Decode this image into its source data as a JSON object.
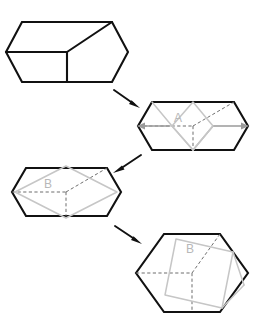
{
  "figure": {
    "background_color": "#ffffff",
    "width": 254,
    "height": 335,
    "colors": {
      "outline": "#111111",
      "hidden_edge": "#666666",
      "ghost_shape": "#c6c6c6",
      "label_text": "#b8b8b8",
      "span_arrow": "#9a9a9a"
    }
  },
  "panels": [
    {
      "id": "panel-1",
      "name": "cube-isometric",
      "label": "",
      "description": "Isometric cube drawn as a hexagon with three visible faces meeting at the center vertex",
      "center": {
        "x": 67,
        "y": 52
      },
      "radius": 52,
      "has_label": false,
      "has_ghost": false,
      "has_hidden_edges": false,
      "has_span_arrows": false
    },
    {
      "id": "panel-2",
      "name": "hexagon-with-rhombus-a",
      "label": "A",
      "description": "Hexagon with hidden dashed edges and a tall light-gray rhombus labelled A, with horizontal span arrows",
      "center": {
        "x": 193,
        "y": 126
      },
      "radius": 48,
      "has_label": true,
      "has_ghost": true,
      "has_hidden_edges": true,
      "has_span_arrows": true
    },
    {
      "id": "panel-3",
      "name": "hexagon-with-square-b",
      "label": "B",
      "description": "Hexagon with hidden dashed edges and a light-gray square rotated 45 degrees labelled B",
      "center": {
        "x": 66,
        "y": 192
      },
      "radius": 48,
      "has_label": true,
      "has_ghost": true,
      "has_hidden_edges": true,
      "has_span_arrows": false
    },
    {
      "id": "panel-4",
      "name": "hexagon-with-tilted-square-b",
      "label": "B",
      "description": "Hexagon with hidden dashed edges and a light-gray tilted square labelled B",
      "center": {
        "x": 192,
        "y": 273
      },
      "radius": 53,
      "has_label": true,
      "has_ghost": true,
      "has_hidden_edges": true,
      "has_span_arrows": false
    }
  ],
  "arrows": [
    {
      "id": "arrow-1",
      "name": "arrow-panel1-to-panel2",
      "direction": "down-right",
      "from": "panel-1",
      "to": "panel-2",
      "start": {
        "x": 114,
        "y": 90
      },
      "end": {
        "x": 139,
        "y": 107
      }
    },
    {
      "id": "arrow-2",
      "name": "arrow-panel2-to-panel3",
      "direction": "down-left",
      "from": "panel-2",
      "to": "panel-3",
      "start": {
        "x": 141,
        "y": 155
      },
      "end": {
        "x": 114,
        "y": 172
      }
    },
    {
      "id": "arrow-3",
      "name": "arrow-panel3-to-panel4",
      "direction": "down-right",
      "from": "panel-3",
      "to": "panel-4",
      "start": {
        "x": 115,
        "y": 226
      },
      "end": {
        "x": 141,
        "y": 243
      }
    }
  ],
  "span_arrows": [
    {
      "id": "span-left",
      "name": "span-arrow-left",
      "direction": "left",
      "from": {
        "x": 172,
        "y": 126
      },
      "to": {
        "x": 138,
        "y": 126
      }
    },
    {
      "id": "span-right",
      "name": "span-arrow-right",
      "direction": "right",
      "from": {
        "x": 213,
        "y": 126
      },
      "to": {
        "x": 248,
        "y": 126
      }
    }
  ],
  "labels": {
    "panel_2_label": "A",
    "panel_3_label": "B",
    "panel_4_label": "B"
  }
}
